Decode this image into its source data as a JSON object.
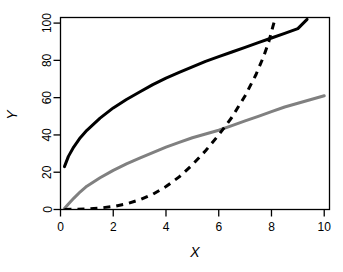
{
  "chart_data": {
    "type": "line",
    "title": "",
    "subtitle": "",
    "xlabel": "X",
    "ylabel": "Y",
    "xlim": [
      0,
      10.2
    ],
    "ylim": [
      0,
      103
    ],
    "grid": false,
    "legend": "none",
    "background_color": "#ffffff",
    "box_color": "#000000",
    "xticks": [
      0,
      2,
      4,
      6,
      8,
      10
    ],
    "xtick_labels": [
      "0",
      "2",
      "4",
      "6",
      "8",
      "10"
    ],
    "yticks": [
      0,
      20,
      40,
      60,
      80,
      100
    ],
    "ytick_labels": [
      "0",
      "20",
      "40",
      "60",
      "80",
      "100"
    ],
    "series": [
      {
        "name": "concave-black-solid",
        "color": "#000000",
        "linestyle": "solid",
        "linewidth": 3,
        "x": [
          0.15,
          0.3,
          0.5,
          0.75,
          1.0,
          1.5,
          2.0,
          2.5,
          3.0,
          3.5,
          4.0,
          4.5,
          5.0,
          5.5,
          6.0,
          6.5,
          7.0,
          7.5,
          8.0,
          8.5,
          9.0,
          9.35
        ],
        "values": [
          23.0,
          28.5,
          33.5,
          38.5,
          42.5,
          49.0,
          54.5,
          59.0,
          63.0,
          67.0,
          70.5,
          73.5,
          76.5,
          79.5,
          82.0,
          84.5,
          87.0,
          89.5,
          92.0,
          94.5,
          97.0,
          102.0
        ]
      },
      {
        "name": "linear-gray-solid",
        "color": "#808080",
        "linestyle": "solid",
        "linewidth": 3,
        "x": [
          0.15,
          0.3,
          0.5,
          0.75,
          1.0,
          1.5,
          2.0,
          2.5,
          3.0,
          3.5,
          4.0,
          4.5,
          5.0,
          5.5,
          6.0,
          6.5,
          7.0,
          7.5,
          8.0,
          8.5,
          9.0,
          9.5,
          10.0
        ],
        "values": [
          0.5,
          3.0,
          6.0,
          9.5,
          12.5,
          17.0,
          21.0,
          24.5,
          27.5,
          30.5,
          33.5,
          36.0,
          38.5,
          40.5,
          42.5,
          45.0,
          47.5,
          50.0,
          52.5,
          55.0,
          57.0,
          59.0,
          61.0
        ]
      },
      {
        "name": "convex-black-dashed",
        "color": "#000000",
        "linestyle": "dashed",
        "linewidth": 3,
        "dasharray": "7,6",
        "x": [
          0.15,
          0.5,
          1.0,
          1.5,
          2.0,
          2.5,
          3.0,
          3.5,
          4.0,
          4.5,
          5.0,
          5.5,
          6.0,
          6.5,
          7.0,
          7.4,
          7.7,
          7.9,
          8.05,
          8.15
        ],
        "values": [
          0.0,
          0.1,
          0.3,
          0.8,
          1.6,
          3.0,
          5.2,
          8.2,
          12.3,
          17.5,
          24.0,
          31.5,
          40.0,
          49.5,
          61.0,
          72.0,
          82.0,
          90.0,
          98.0,
          103.0
        ]
      }
    ]
  },
  "axes": {
    "x_title": "X",
    "y_title": "Y"
  }
}
